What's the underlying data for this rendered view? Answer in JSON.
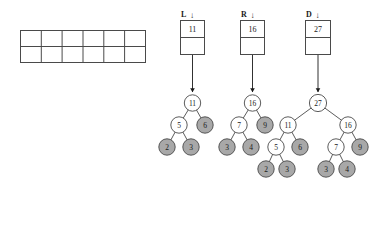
{
  "figure": {
    "grid": {
      "rows": 2,
      "cols": 6,
      "cells": [
        "",
        "",
        "",
        "",
        "",
        "",
        "",
        "",
        "",
        "",
        "",
        ""
      ]
    },
    "pointers": [
      {
        "name": "L",
        "label": "L",
        "arrow": "↓",
        "value": "11",
        "second_cell": ""
      },
      {
        "name": "R",
        "label": "R",
        "arrow": "↓",
        "value": "16",
        "second_cell": ""
      },
      {
        "name": "D",
        "label": "D",
        "arrow": "↓",
        "value": "27",
        "second_cell": ""
      }
    ],
    "trees": [
      {
        "name": "L",
        "root": "11",
        "nodes": [
          {
            "id": "L-root",
            "value": "11",
            "fill": "white"
          },
          {
            "id": "L-5",
            "value": "5",
            "fill": "white"
          },
          {
            "id": "L-6",
            "value": "6",
            "fill": "gray"
          },
          {
            "id": "L-2",
            "value": "2",
            "fill": "gray"
          },
          {
            "id": "L-3",
            "value": "3",
            "fill": "gray"
          }
        ]
      },
      {
        "name": "R",
        "root": "16",
        "nodes": [
          {
            "id": "R-root",
            "value": "16",
            "fill": "white"
          },
          {
            "id": "R-7",
            "value": "7",
            "fill": "white"
          },
          {
            "id": "R-9",
            "value": "9",
            "fill": "gray"
          },
          {
            "id": "R-3",
            "value": "3",
            "fill": "gray"
          },
          {
            "id": "R-4",
            "value": "4",
            "fill": "gray"
          }
        ]
      },
      {
        "name": "D",
        "root": "27",
        "nodes": [
          {
            "id": "D-root",
            "value": "27",
            "fill": "white"
          },
          {
            "id": "D-11",
            "value": "11",
            "fill": "white"
          },
          {
            "id": "D-16",
            "value": "16",
            "fill": "white"
          },
          {
            "id": "D-5",
            "value": "5",
            "fill": "white"
          },
          {
            "id": "D-6",
            "value": "6",
            "fill": "gray"
          },
          {
            "id": "D-7",
            "value": "7",
            "fill": "white"
          },
          {
            "id": "D-9",
            "value": "9",
            "fill": "gray"
          },
          {
            "id": "D-2",
            "value": "2",
            "fill": "gray"
          },
          {
            "id": "D-3a",
            "value": "3",
            "fill": "gray"
          },
          {
            "id": "D-3b",
            "value": "3",
            "fill": "gray"
          },
          {
            "id": "D-4",
            "value": "4",
            "fill": "gray"
          }
        ]
      }
    ],
    "colors": {
      "stroke": "#4a4a4a",
      "node_gray": "#a8a8a8",
      "node_white": "#ffffff",
      "text": "#1a1a1a",
      "background": "#ffffff"
    }
  }
}
